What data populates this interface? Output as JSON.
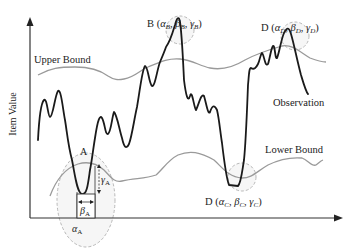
{
  "figure": {
    "y_axis_label": "Item Value",
    "upper_bound_label": "Upper Bound",
    "lower_bound_label": "Lower Bound",
    "observation_label": "Observation",
    "points": {
      "A": {
        "name": "A",
        "alpha": "α",
        "alpha_sub": "A",
        "beta": "β",
        "beta_sub": "A",
        "gamma": "γ",
        "gamma_sub": "A"
      },
      "B": {
        "prefix": "B (",
        "alpha": "α",
        "alpha_sub": "B",
        "sep1": ", ",
        "beta": "β",
        "beta_sub": "B",
        "sep2": ", ",
        "gamma": "γ",
        "gamma_sub": "B",
        "suffix": ")"
      },
      "C": {
        "prefix": "D (",
        "alpha": "α",
        "alpha_sub": "C",
        "sep1": ", ",
        "beta": "β",
        "beta_sub": "C",
        "sep2": ", ",
        "gamma": "γ",
        "gamma_sub": "C",
        "suffix": ")"
      },
      "D": {
        "prefix": "D (",
        "alpha": "α",
        "alpha_sub": "D",
        "sep1": ", ",
        "beta": "β",
        "beta_sub": "D",
        "sep2": ", ",
        "gamma": "γ",
        "gamma_sub": "D",
        "suffix": ")"
      }
    },
    "colors": {
      "observation": "#1a1a1a",
      "bounds": "#9a9a9a",
      "highlight": "#eeeeee"
    }
  }
}
